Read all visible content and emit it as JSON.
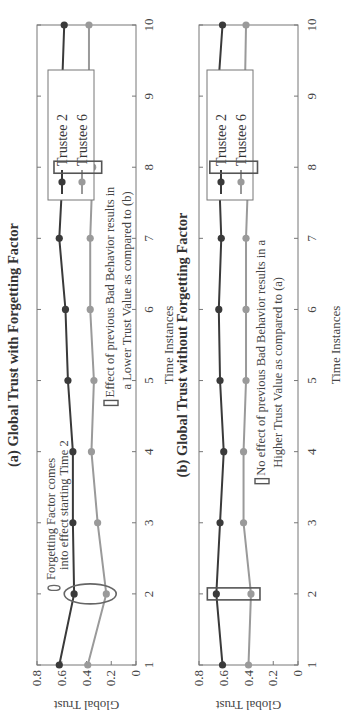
{
  "figure": {
    "orientation": "rotated 90° counter-clockwise",
    "colors": {
      "trustee2": "#3a3a3a",
      "trustee6": "#9a9a9a",
      "axis": "#777777",
      "annotation_box": "#555555",
      "ellipse": "#666666"
    }
  },
  "chart_data": [
    {
      "type": "line",
      "title": "(a) Global Trust with Forgetting Factor",
      "xlabel": "Time Instances",
      "ylabel": "Global Trust",
      "x": [
        1,
        2,
        3,
        4,
        5,
        6,
        7,
        8,
        9,
        10
      ],
      "xticks": [
        "1",
        "2",
        "3",
        "4",
        "5",
        "6",
        "7",
        "8",
        "9",
        "10"
      ],
      "yticks": [
        "0",
        "0.2",
        "0.4",
        "0.6",
        "0.8"
      ],
      "xlim": [
        1,
        10
      ],
      "ylim": [
        0,
        0.8
      ],
      "grid": false,
      "legend_position": "upper right",
      "series": [
        {
          "name": "Trustee 2",
          "values": [
            0.62,
            0.5,
            0.51,
            0.51,
            0.55,
            0.57,
            0.62,
            0.59,
            0.6,
            0.58
          ]
        },
        {
          "name": "Trustee 6",
          "values": [
            0.39,
            0.24,
            0.31,
            0.36,
            0.34,
            0.37,
            0.37,
            0.35,
            0.38,
            0.38
          ]
        }
      ],
      "annotations": [
        {
          "shape": "ellipse",
          "at_x": 2,
          "text_lines": [
            "Forgetting Factor comes",
            "into effect starting Time 2"
          ]
        },
        {
          "shape": "rectangle",
          "at_x": 8,
          "text_lines": [
            "Effect of previous Bad Behavior results in",
            "a Lower Trust Value as compared to (b)"
          ]
        }
      ]
    },
    {
      "type": "line",
      "title": "(b) Global Trust without Forgetting Factor",
      "xlabel": "Time Instances",
      "ylabel": "Global Trust",
      "x": [
        1,
        2,
        3,
        4,
        5,
        6,
        7,
        8,
        9,
        10
      ],
      "xticks": [
        "1",
        "2",
        "3",
        "4",
        "5",
        "6",
        "7",
        "8",
        "9",
        "10"
      ],
      "yticks": [
        "0",
        "0.2",
        "0.4",
        "0.6",
        "0.8"
      ],
      "xlim": [
        1,
        10
      ],
      "ylim": [
        0,
        0.8
      ],
      "grid": false,
      "legend_position": "upper right",
      "series": [
        {
          "name": "Trustee 2",
          "values": [
            0.61,
            0.66,
            0.63,
            0.6,
            0.63,
            0.64,
            0.62,
            0.64,
            0.65,
            0.61
          ]
        },
        {
          "name": "Trustee 6",
          "values": [
            0.4,
            0.38,
            0.44,
            0.44,
            0.42,
            0.42,
            0.42,
            0.4,
            0.43,
            0.42
          ]
        }
      ],
      "annotations": [
        {
          "shape": "rectangle",
          "at_x": 2,
          "text_lines": [
            "No effect of previous Bad Behavior results in a",
            "Higher Trust Value as compared to (a)"
          ]
        },
        {
          "shape": "rectangle",
          "at_x": 8,
          "text_lines": []
        }
      ]
    }
  ]
}
